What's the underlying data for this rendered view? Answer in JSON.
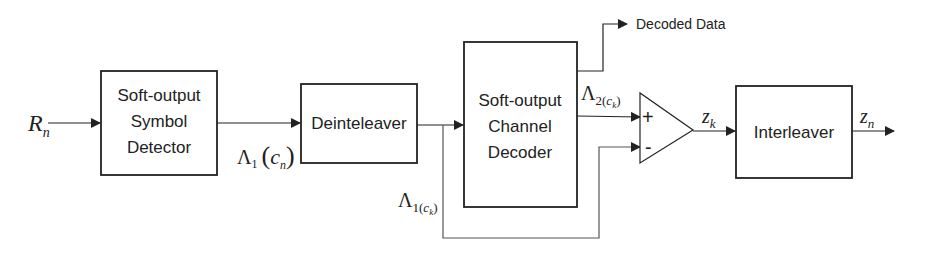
{
  "diagram": {
    "type": "block-diagram",
    "blocks": [
      {
        "id": "symbol-detector",
        "lines": [
          "Soft-output",
          "Symbol",
          "Detector"
        ]
      },
      {
        "id": "deinterleaver",
        "lines": [
          "Deinteleaver"
        ]
      },
      {
        "id": "channel-decoder",
        "lines": [
          "Soft-output",
          "Channel",
          "Decoder"
        ]
      },
      {
        "id": "summer",
        "plus": "+",
        "minus": "-"
      },
      {
        "id": "interleaver",
        "lines": [
          "Interleaver"
        ]
      }
    ],
    "signals": {
      "input": {
        "main": "R",
        "sub": "n"
      },
      "lambda1_cn": {
        "main": "Λ",
        "sub": "1",
        "paren_open": "(",
        "var": "c",
        "var_sub": "n",
        "paren_close": ")"
      },
      "lambda1_ck": {
        "main": "Λ",
        "sub": "1(",
        "var": "c",
        "var_sub": "k",
        "close": ")"
      },
      "lambda2_ck": {
        "main": "Λ",
        "sub": "2(",
        "var": "c",
        "var_sub": "k",
        "close": ")"
      },
      "zk": {
        "main": "z",
        "sub": "k"
      },
      "zn": {
        "main": "z",
        "sub": "n"
      }
    },
    "outputs": {
      "decoded": "Decoded Data"
    },
    "colors": {
      "stroke": "#222222",
      "feedback_stroke": "#555555",
      "background": "#ffffff"
    }
  }
}
